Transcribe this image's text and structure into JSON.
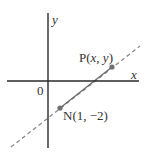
{
  "diagram": {
    "type": "coordinate-plane",
    "axes": {
      "x_label": "x",
      "y_label": "y",
      "origin_label": "0"
    },
    "points": [
      {
        "id": "P",
        "label": "P(x, y)",
        "label_name": "P",
        "coords_text": "(x, y)",
        "color": "#707070"
      },
      {
        "id": "N",
        "label": "N(1, −2)",
        "label_name": "N",
        "coords_text": "(1, −2)",
        "coords": [
          1,
          -2
        ],
        "color": "#707070"
      }
    ],
    "line": {
      "style": "dashed",
      "passes_through": [
        "N",
        "P"
      ],
      "segment_between": [
        "N",
        "P"
      ],
      "segment_style": "solid",
      "color": "#8a8a8a"
    }
  }
}
